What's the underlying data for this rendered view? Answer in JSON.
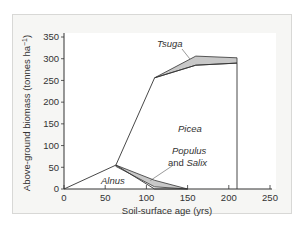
{
  "chart_data": {
    "type": "area",
    "title": "",
    "xlabel": "Soil-surface age (yrs)",
    "ylabel": "Above-ground biomass (tonnes ha⁻¹)",
    "xlim": [
      0,
      250
    ],
    "ylim": [
      0,
      350
    ],
    "xticks": [
      0,
      50,
      100,
      150,
      200,
      250
    ],
    "yticks": [
      0,
      50,
      100,
      150,
      200,
      250,
      300,
      350
    ],
    "grid": false,
    "series": [
      {
        "name": "Alnus",
        "role": "outline",
        "points": [
          [
            0,
            0
          ],
          [
            63,
            55
          ],
          [
            110,
            0
          ],
          [
            150,
            0
          ]
        ]
      },
      {
        "name": "Populus and Salix",
        "role": "shaded band",
        "upper": [
          [
            63,
            55
          ],
          [
            110,
            20
          ],
          [
            150,
            0
          ]
        ],
        "lower": [
          [
            63,
            52
          ],
          [
            110,
            5
          ],
          [
            150,
            0
          ]
        ]
      },
      {
        "name": "Picea",
        "role": "outline",
        "points": [
          [
            63,
            55
          ],
          [
            110,
            256
          ],
          [
            160,
            285
          ],
          [
            210,
            290
          ],
          [
            210,
            0
          ]
        ]
      },
      {
        "name": "Tsuga",
        "role": "shaded band",
        "upper": [
          [
            110,
            256
          ],
          [
            160,
            306
          ],
          [
            210,
            302
          ]
        ],
        "lower": [
          [
            110,
            256
          ],
          [
            160,
            285
          ],
          [
            210,
            290
          ]
        ]
      }
    ],
    "annotations": [
      {
        "text": "Tsuga",
        "italic": true,
        "points_to": [
          160,
          295
        ]
      },
      {
        "text": "Picea",
        "italic": true
      },
      {
        "text_italic": "Populus",
        "text_line2_plain": "and",
        "text_line2_italic": "Salix",
        "points_to": [
          100,
          15
        ]
      },
      {
        "text": "Alnus",
        "italic": true
      }
    ],
    "colors": {
      "band_fill": "#c8c8c8",
      "line": "#333333",
      "panel_bg": "#f6f6f4",
      "plot_bg": "#ffffff"
    }
  }
}
